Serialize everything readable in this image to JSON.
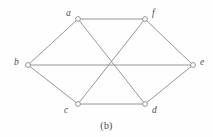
{
  "figure": {
    "caption": "(b)",
    "caption_x": 0,
    "caption_y": 120,
    "width": 213,
    "height": 137,
    "background_color": "#fefefe",
    "edge_color": "#8a8a8a",
    "edge_width": 0.9,
    "vertex_stroke_color": "#8a8a8a",
    "vertex_fill_color": "#ffffff",
    "vertex_radius": 2.4,
    "label_color": "#4a4a4a"
  },
  "graph": {
    "type": "undirected-graph",
    "vertex_count": 6,
    "edge_count": 9,
    "vertices": [
      {
        "id": "a",
        "label": "a",
        "x": 78,
        "y": 19,
        "label_x": 66,
        "label_y": 9
      },
      {
        "id": "f",
        "label": "f",
        "x": 145,
        "y": 19,
        "label_x": 152,
        "label_y": 9
      },
      {
        "id": "b",
        "label": "b",
        "x": 28,
        "y": 65,
        "label_x": 14,
        "label_y": 58
      },
      {
        "id": "e",
        "label": "e",
        "x": 193,
        "y": 65,
        "label_x": 200,
        "label_y": 58
      },
      {
        "id": "c",
        "label": "c",
        "x": 78,
        "y": 104,
        "label_x": 64,
        "label_y": 106
      },
      {
        "id": "d",
        "label": "d",
        "x": 145,
        "y": 104,
        "label_x": 152,
        "label_y": 106
      }
    ],
    "edges": [
      {
        "id": "edge-b-a",
        "from": "b",
        "to": "a"
      },
      {
        "id": "edge-a-f",
        "from": "a",
        "to": "f"
      },
      {
        "id": "edge-f-e",
        "from": "f",
        "to": "e"
      },
      {
        "id": "edge-b-c",
        "from": "b",
        "to": "c"
      },
      {
        "id": "edge-c-d",
        "from": "c",
        "to": "d"
      },
      {
        "id": "edge-d-e",
        "from": "d",
        "to": "e"
      },
      {
        "id": "edge-b-e",
        "from": "b",
        "to": "e"
      },
      {
        "id": "edge-a-d",
        "from": "a",
        "to": "d"
      },
      {
        "id": "edge-f-c",
        "from": "f",
        "to": "c"
      }
    ]
  }
}
